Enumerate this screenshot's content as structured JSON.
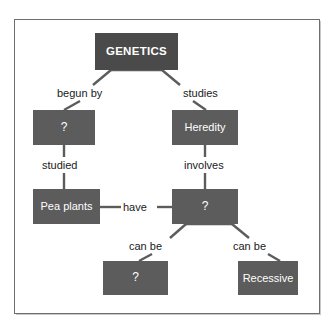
{
  "figure": {
    "top_sliver_text": "......................",
    "frame_border_color": "#6e6e6e",
    "node_fill_color": "#5c5c5c",
    "root_fill_color": "#4a4a4a",
    "node_text_color": "#ffffff",
    "label_text_color": "#1a1a1a",
    "background_color": "#ffffff"
  },
  "concept_map": {
    "title": "GENETICS",
    "nodes": [
      {
        "id": "genetics",
        "label": "GENETICS",
        "role": "root"
      },
      {
        "id": "founder",
        "label": "?",
        "role": "unknown"
      },
      {
        "id": "heredity",
        "label": "Heredity",
        "role": "concept"
      },
      {
        "id": "peaplants",
        "label": "Pea plants",
        "role": "concept"
      },
      {
        "id": "traits",
        "label": "?",
        "role": "unknown"
      },
      {
        "id": "dominant",
        "label": "?",
        "role": "unknown"
      },
      {
        "id": "recessive",
        "label": "Recessive",
        "role": "concept"
      }
    ],
    "links": [
      {
        "from": "genetics",
        "to": "founder",
        "label": "begun by"
      },
      {
        "from": "genetics",
        "to": "heredity",
        "label": "studies"
      },
      {
        "from": "founder",
        "to": "peaplants",
        "label": "studied"
      },
      {
        "from": "heredity",
        "to": "traits",
        "label": "involves"
      },
      {
        "from": "peaplants",
        "to": "traits",
        "label": "have"
      },
      {
        "from": "traits",
        "to": "dominant",
        "label": "can be"
      },
      {
        "from": "traits",
        "to": "recessive",
        "label": "can be"
      }
    ]
  }
}
